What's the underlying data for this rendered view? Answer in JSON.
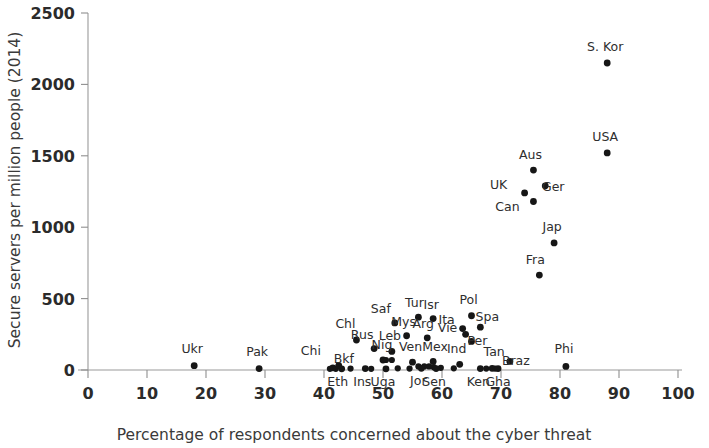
{
  "chart_data": {
    "type": "scatter",
    "title": "",
    "xlabel": "Percentage of respondents concerned about the cyber threat",
    "ylabel": "Secure servers per million people (2014)",
    "xlim": [
      0,
      100
    ],
    "ylim": [
      0,
      2500
    ],
    "xticks": [
      0,
      10,
      20,
      30,
      40,
      50,
      60,
      70,
      80,
      90,
      100
    ],
    "yticks": [
      0,
      500,
      1000,
      1500,
      2000,
      2500
    ],
    "grid": false,
    "legend": "none",
    "marker_color": "#161616",
    "axis_color": "#9a9a9a",
    "points": [
      {
        "label": "Ukr",
        "x": 18.0,
        "y": 30,
        "lx": -2,
        "ly": -13
      },
      {
        "label": "Pak",
        "x": 29.0,
        "y": 10,
        "lx": -2,
        "ly": -13
      },
      {
        "label": "Chi",
        "x": 41.5,
        "y": 15,
        "lx": -22,
        "ly": -13
      },
      {
        "label": "Bkf",
        "x": 42.5,
        "y": 30,
        "lx": 5,
        "ly": -3
      },
      {
        "label": "Eth",
        "x": 43.0,
        "y": 8,
        "lx": -4,
        "ly": 17
      },
      {
        "label": "Chl",
        "x": 45.5,
        "y": 210,
        "lx": -11,
        "ly": -12
      },
      {
        "label": "Ins",
        "x": 47.0,
        "y": 10,
        "lx": -3,
        "ly": 17
      },
      {
        "label": "Rus",
        "x": 48.5,
        "y": 150,
        "lx": -12,
        "ly": -10
      },
      {
        "label": "Nig",
        "x": 50.0,
        "y": 70,
        "lx": -1,
        "ly": -11
      },
      {
        "label": "Uga",
        "x": 50.5,
        "y": 8,
        "lx": -3,
        "ly": 17
      },
      {
        "label": "Leb",
        "x": 51.5,
        "y": 130,
        "lx": -2,
        "ly": -11
      },
      {
        "label": "Saf",
        "x": 52.0,
        "y": 330,
        "lx": -14,
        "ly": -10
      },
      {
        "label": "Mys",
        "x": 54.0,
        "y": 240,
        "lx": -3,
        "ly": -10
      },
      {
        "label": "Ven",
        "x": 55.0,
        "y": 55,
        "lx": -2,
        "ly": -11
      },
      {
        "label": "Tur",
        "x": 56.0,
        "y": 370,
        "lx": -4,
        "ly": -10
      },
      {
        "label": "Jor",
        "x": 56.5,
        "y": 12,
        "lx": -3,
        "ly": 17
      },
      {
        "label": "Arg",
        "x": 57.5,
        "y": 225,
        "lx": -4,
        "ly": -10
      },
      {
        "label": "Isr",
        "x": 58.5,
        "y": 360,
        "lx": -2,
        "ly": -10
      },
      {
        "label": "Mex",
        "x": 58.5,
        "y": 60,
        "lx": 2,
        "ly": -10
      },
      {
        "label": "Sen",
        "x": 59.0,
        "y": 10,
        "lx": -2,
        "ly": 17
      },
      {
        "label": "Ita",
        "x": 63.5,
        "y": 290,
        "lx": -16,
        "ly": -5
      },
      {
        "label": "Vie",
        "x": 64.0,
        "y": 250,
        "lx": -18,
        "ly": -2
      },
      {
        "label": "Ind",
        "x": 63.0,
        "y": 40,
        "lx": -3,
        "ly": -11
      },
      {
        "label": "Pol",
        "x": 65.0,
        "y": 380,
        "lx": -3,
        "ly": -12
      },
      {
        "label": "Per",
        "x": 65.0,
        "y": 200,
        "lx": 6,
        "ly": 4
      },
      {
        "label": "Ken",
        "x": 66.5,
        "y": 10,
        "lx": -2,
        "ly": 17
      },
      {
        "label": "Spa",
        "x": 66.5,
        "y": 300,
        "lx": 7,
        "ly": -6
      },
      {
        "label": "Tan",
        "x": 68.5,
        "y": 12,
        "lx": 2,
        "ly": -12
      },
      {
        "label": "Gha",
        "x": 69.5,
        "y": 10,
        "lx": 0,
        "ly": 17
      },
      {
        "label": "Braz",
        "x": 71.5,
        "y": 60,
        "lx": 6,
        "ly": 4
      },
      {
        "label": "UK",
        "x": 74.0,
        "y": 1240,
        "lx": -26,
        "ly": -4
      },
      {
        "label": "Aus",
        "x": 75.5,
        "y": 1400,
        "lx": -3,
        "ly": -11
      },
      {
        "label": "Can",
        "x": 75.5,
        "y": 1180,
        "lx": -26,
        "ly": 10
      },
      {
        "label": "Fra",
        "x": 76.5,
        "y": 665,
        "lx": -4,
        "ly": -11
      },
      {
        "label": "Ger",
        "x": 77.5,
        "y": 1290,
        "lx": 8,
        "ly": 5
      },
      {
        "label": "Jap",
        "x": 79.0,
        "y": 890,
        "lx": -2,
        "ly": -12
      },
      {
        "label": "Phi",
        "x": 81.0,
        "y": 25,
        "lx": -2,
        "ly": -13
      },
      {
        "label": "USA",
        "x": 88.0,
        "y": 1520,
        "lx": -2,
        "ly": -12
      },
      {
        "label": "S. Kor",
        "x": 88.0,
        "y": 2150,
        "lx": -2,
        "ly": -12
      }
    ],
    "extra_points": [
      {
        "x": 41.0,
        "y": 8
      },
      {
        "x": 42.0,
        "y": 8
      },
      {
        "x": 44.5,
        "y": 10
      },
      {
        "x": 48.0,
        "y": 8
      },
      {
        "x": 50.5,
        "y": 70
      },
      {
        "x": 51.5,
        "y": 70
      },
      {
        "x": 52.5,
        "y": 12
      },
      {
        "x": 54.5,
        "y": 10
      },
      {
        "x": 56.0,
        "y": 25
      },
      {
        "x": 57.0,
        "y": 25
      },
      {
        "x": 57.8,
        "y": 25
      },
      {
        "x": 58.6,
        "y": 20
      },
      {
        "x": 59.8,
        "y": 15
      },
      {
        "x": 62.0,
        "y": 12
      },
      {
        "x": 67.5,
        "y": 10
      },
      {
        "x": 69.0,
        "y": 10
      }
    ]
  }
}
